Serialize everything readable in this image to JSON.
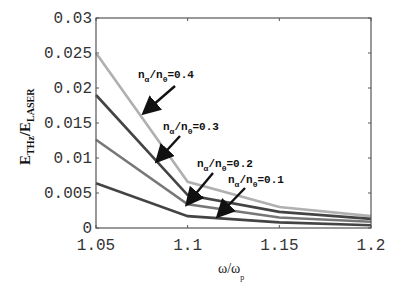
{
  "chart_data": {
    "type": "line",
    "title": "",
    "xlabel": "ω/ω_p",
    "ylabel": "E_THz/E_LASER",
    "x": [
      1.05,
      1.1,
      1.15,
      1.2
    ],
    "xlim": [
      1.05,
      1.2
    ],
    "ylim": [
      0,
      0.03
    ],
    "xticks": [
      "1.05",
      "1.1",
      "1.15",
      "1.2"
    ],
    "yticks": [
      "0",
      "0.005",
      "0.01",
      "0.015",
      "0.02",
      "0.025",
      "0.03"
    ],
    "grid": false,
    "legend": "annotations with arrows",
    "series": [
      {
        "name": "n_α/n_0=0.4",
        "values": [
          0.025,
          0.0066,
          0.003,
          0.0017
        ],
        "color": "#b0b0b0"
      },
      {
        "name": "n_α/n_0=0.3",
        "values": [
          0.019,
          0.0047,
          0.0023,
          0.0013
        ],
        "color": "#444444"
      },
      {
        "name": "n_α/n_0=0.2",
        "values": [
          0.0126,
          0.0034,
          0.0015,
          0.0009
        ],
        "color": "#777777"
      },
      {
        "name": "n_α/n_0=0.1",
        "values": [
          0.0064,
          0.0017,
          0.0008,
          0.0004
        ],
        "color": "#444444"
      }
    ],
    "annotations": [
      {
        "text_main": "n",
        "sub1": "α",
        "mid": "/n",
        "sub2": "0",
        "tail": "=0.4"
      },
      {
        "text_main": "n",
        "sub1": "α",
        "mid": "/n",
        "sub2": "0",
        "tail": "=0.3"
      },
      {
        "text_main": "n",
        "sub1": "α",
        "mid": "/n",
        "sub2": "0",
        "tail": "=0.2"
      },
      {
        "text_main": "n",
        "sub1": "α",
        "mid": "/n",
        "sub2": "0",
        "tail": "=0.1"
      }
    ]
  },
  "axes": {
    "x_main": "ω/ω",
    "x_sub": "p",
    "y_main1": "E",
    "y_sub1": "THz",
    "y_mid": "/E",
    "y_sub2": "LASER"
  }
}
